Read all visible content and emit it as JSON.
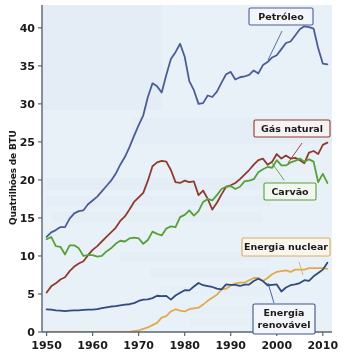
{
  "chart_data": {
    "type": "line",
    "title": "",
    "subtitle": "",
    "xlabel": "",
    "ylabel": "Quatrilhões de BTU",
    "xlim": [
      1949,
      2012
    ],
    "ylim": [
      0,
      43
    ],
    "grid": false,
    "legend_position": "inline-callout-boxes",
    "x_ticks": [
      "1950",
      "1960",
      "1970",
      "1980",
      "1990",
      "2000",
      "2010"
    ],
    "x_tick_values": [
      1950,
      1960,
      1970,
      1980,
      1990,
      2000,
      2010
    ],
    "y_ticks": [
      "0",
      "5",
      "10",
      "15",
      "20",
      "25",
      "30",
      "35",
      "40"
    ],
    "y_tick_values": [
      0,
      5,
      10,
      15,
      20,
      25,
      30,
      35,
      40
    ],
    "x": [
      1950,
      1951,
      1952,
      1953,
      1954,
      1955,
      1956,
      1957,
      1958,
      1959,
      1960,
      1961,
      1962,
      1963,
      1964,
      1965,
      1966,
      1967,
      1968,
      1969,
      1970,
      1971,
      1972,
      1973,
      1974,
      1975,
      1976,
      1977,
      1978,
      1979,
      1980,
      1981,
      1982,
      1983,
      1984,
      1985,
      1986,
      1987,
      1988,
      1989,
      1990,
      1991,
      1992,
      1993,
      1994,
      1995,
      1996,
      1997,
      1998,
      1999,
      2000,
      2001,
      2002,
      2003,
      2004,
      2005,
      2006,
      2007,
      2008,
      2009,
      2010,
      2011
    ],
    "series": [
      {
        "name": "Petróleo",
        "color": "#4a5d96",
        "label_border": "#4a5d96",
        "values": [
          12.5,
          13.1,
          13.4,
          13.8,
          13.8,
          14.9,
          15.6,
          15.9,
          16.0,
          16.8,
          17.3,
          17.8,
          18.5,
          19.2,
          19.9,
          20.8,
          22.0,
          23.0,
          24.3,
          25.8,
          27.2,
          28.5,
          30.9,
          32.7,
          32.3,
          31.5,
          33.8,
          35.9,
          36.8,
          37.9,
          36.2,
          33.0,
          31.8,
          30.0,
          30.1,
          31.1,
          30.9,
          31.6,
          32.8,
          33.9,
          34.2,
          33.2,
          33.5,
          33.6,
          33.8,
          34.4,
          34.0,
          35.1,
          35.5,
          36.1,
          36.4,
          37.2,
          38.0,
          38.2,
          39.0,
          39.8,
          40.2,
          40.1,
          39.9,
          37.3,
          35.3,
          35.2
        ]
      },
      {
        "name": "Gás natural",
        "color": "#8e3b2f",
        "label_border": "#8e3b2f",
        "values": [
          5.2,
          6.0,
          6.4,
          6.9,
          7.2,
          8.0,
          8.6,
          9.0,
          9.3,
          10.1,
          10.8,
          11.3,
          11.9,
          12.5,
          13.1,
          13.7,
          14.6,
          15.2,
          16.1,
          17.1,
          17.7,
          18.3,
          19.9,
          21.8,
          22.3,
          22.5,
          22.4,
          21.3,
          19.7,
          19.6,
          19.9,
          19.7,
          19.8,
          18.0,
          18.6,
          17.5,
          16.1,
          17.0,
          18.1,
          19.1,
          19.3,
          19.6,
          20.1,
          20.7,
          21.3,
          22.0,
          22.6,
          22.8,
          22.0,
          22.4,
          23.4,
          22.8,
          23.2,
          22.8,
          22.9,
          22.6,
          22.2,
          23.6,
          23.8,
          23.4,
          24.6,
          24.9
        ]
      },
      {
        "name": "Carvão",
        "color": "#57a038",
        "label_border": "#57a038",
        "values": [
          12.2,
          12.5,
          11.3,
          11.2,
          10.2,
          11.4,
          11.4,
          11.0,
          10.0,
          10.1,
          10.1,
          9.9,
          10.0,
          10.6,
          11.0,
          11.6,
          12.0,
          11.9,
          12.3,
          12.4,
          12.3,
          11.6,
          12.1,
          13.2,
          12.9,
          12.7,
          13.6,
          13.9,
          13.8,
          15.1,
          15.4,
          16.0,
          15.3,
          15.9,
          17.1,
          17.5,
          17.3,
          18.0,
          18.8,
          19.1,
          19.2,
          18.8,
          19.1,
          19.8,
          19.9,
          20.1,
          21.0,
          21.4,
          21.7,
          21.6,
          22.6,
          21.9,
          21.9,
          22.3,
          22.5,
          22.8,
          22.4,
          22.7,
          22.4,
          19.7,
          20.8,
          19.6
        ]
      },
      {
        "name": "Energia nuclear",
        "color": "#e2a94c",
        "label_border": "#d9ab62",
        "values": [
          0,
          0,
          0,
          0,
          0,
          0,
          0,
          0,
          0,
          0,
          0,
          0,
          0,
          0,
          0,
          0,
          0,
          0,
          0,
          0.1,
          0.2,
          0.4,
          0.6,
          0.9,
          1.2,
          1.9,
          2.1,
          2.7,
          3.0,
          2.8,
          2.7,
          3.0,
          3.1,
          3.2,
          3.6,
          4.1,
          4.5,
          4.9,
          5.6,
          5.7,
          6.1,
          6.4,
          6.5,
          6.5,
          6.8,
          7.1,
          7.1,
          6.7,
          7.1,
          7.6,
          7.9,
          8.0,
          8.1,
          7.9,
          8.2,
          8.2,
          8.2,
          8.4,
          8.4,
          8.4,
          8.4,
          8.3
        ]
      },
      {
        "name": "Energia renovável",
        "color": "#2f4a7c",
        "label_border": "#3c5488",
        "values": [
          2.98,
          2.95,
          2.85,
          2.8,
          2.75,
          2.8,
          2.85,
          2.85,
          2.9,
          2.95,
          2.95,
          3.0,
          3.15,
          3.25,
          3.35,
          3.4,
          3.5,
          3.6,
          3.65,
          3.8,
          4.08,
          4.25,
          4.3,
          4.45,
          4.77,
          4.72,
          4.75,
          4.25,
          4.8,
          5.15,
          5.49,
          5.48,
          5.98,
          6.45,
          6.15,
          6.04,
          5.92,
          5.7,
          5.6,
          6.25,
          6.21,
          6.2,
          6.05,
          6.24,
          6.24,
          6.7,
          7.0,
          6.7,
          6.15,
          6.2,
          6.26,
          5.33,
          5.85,
          6.15,
          6.26,
          6.44,
          6.81,
          6.72,
          7.32,
          7.75,
          8.2,
          9.1
        ]
      }
    ],
    "callouts": [
      {
        "label": "Petróleo",
        "series": "Petróleo",
        "border": "#4a5d96"
      },
      {
        "label": "Gás natural",
        "series": "Gás natural",
        "border": "#8e3b2f"
      },
      {
        "label": "Carvão",
        "series": "Carvão",
        "border": "#57a038"
      },
      {
        "label": "Energia nuclear",
        "series": "Energia nuclear",
        "border": "#d9ab62"
      },
      {
        "label": "Energia",
        "label_line2": "renovável",
        "series": "Energia renovável",
        "border": "#3c5488"
      }
    ]
  },
  "style": {
    "plot_background": "#e9f1f8",
    "page_background": "#ffffff",
    "axis_color": "#5a6472",
    "tick_text_color": "#1a1a1a"
  }
}
